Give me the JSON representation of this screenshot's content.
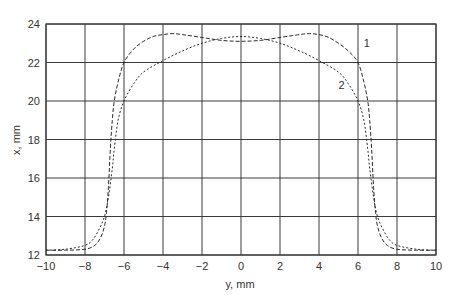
{
  "chart_data": {
    "type": "line",
    "title": "",
    "xlabel": "y, mm",
    "ylabel": "x, mm",
    "xlim": [
      -10,
      10
    ],
    "ylim": [
      12,
      24
    ],
    "xticks": [
      -10,
      -8,
      -6,
      -4,
      -2,
      0,
      2,
      4,
      6,
      8,
      10
    ],
    "yticks": [
      12,
      14,
      16,
      18,
      20,
      22,
      24
    ],
    "grid": true,
    "legend": "inline labels",
    "series": [
      {
        "name": "1",
        "style": "dashed",
        "x": [
          -10,
          -9,
          -8,
          -7.5,
          -7.2,
          -7.0,
          -6.9,
          -6.8,
          -6.7,
          -6.6,
          -6.5,
          -6.3,
          -6.0,
          -5.5,
          -5.0,
          -4.5,
          -4.0,
          -3.5,
          -3.0,
          -2.0,
          -1.0,
          0,
          1.0,
          2.0,
          3.0,
          3.5,
          4.0,
          4.5,
          5.0,
          5.5,
          6.0,
          6.3,
          6.5,
          6.6,
          6.7,
          6.8,
          6.9,
          7.0,
          7.2,
          7.5,
          8,
          9,
          10
        ],
        "y": [
          12.25,
          12.25,
          12.3,
          12.5,
          12.9,
          13.5,
          14.2,
          15.5,
          17.5,
          19.0,
          20.0,
          21.0,
          22.0,
          22.7,
          23.1,
          23.35,
          23.45,
          23.5,
          23.45,
          23.3,
          23.15,
          23.1,
          23.15,
          23.3,
          23.45,
          23.5,
          23.45,
          23.3,
          23.0,
          22.6,
          22.0,
          21.0,
          20.0,
          19.0,
          17.5,
          15.5,
          14.2,
          13.5,
          12.9,
          12.5,
          12.3,
          12.25,
          12.25
        ]
      },
      {
        "name": "2",
        "style": "dotted",
        "x": [
          -10,
          -9,
          -8,
          -7.6,
          -7.3,
          -7.0,
          -6.8,
          -6.6,
          -6.5,
          -6.3,
          -6.0,
          -5.5,
          -5.0,
          -4.0,
          -3.0,
          -2.0,
          -1.0,
          0,
          1.0,
          2.0,
          3.0,
          4.0,
          5.0,
          5.5,
          6.0,
          6.3,
          6.5,
          6.6,
          6.8,
          7.0,
          7.3,
          7.6,
          8,
          9,
          10
        ],
        "y": [
          12.25,
          12.3,
          12.5,
          12.8,
          13.3,
          14.0,
          15.0,
          16.5,
          17.5,
          19.0,
          20.0,
          20.9,
          21.5,
          22.1,
          22.6,
          23.0,
          23.25,
          23.35,
          23.25,
          23.0,
          22.6,
          22.1,
          21.5,
          20.9,
          20.0,
          19.0,
          17.5,
          16.5,
          15.0,
          14.0,
          13.3,
          12.8,
          12.5,
          12.3,
          12.25
        ]
      }
    ],
    "annotations": [
      {
        "text": "1",
        "x": 6.3,
        "y": 22.8
      },
      {
        "text": "2",
        "x": 5.0,
        "y": 20.6
      }
    ]
  },
  "labels": {
    "xlabel": "y, mm",
    "ylabel": "x, mm",
    "curve1": "1",
    "curve2": "2"
  },
  "colors": {
    "grid": "#3a3a3a",
    "line": "#2a2a2a",
    "text": "#333333"
  }
}
